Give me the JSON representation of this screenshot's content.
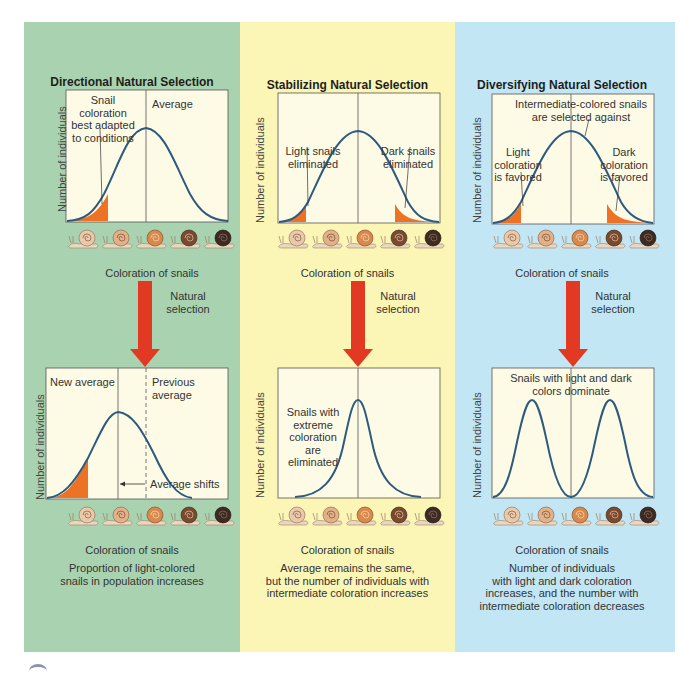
{
  "colors": {
    "green_panel": "#a9d3b0",
    "yellow_panel": "#fbf5b6",
    "blue_panel": "#c3e6f4",
    "plot_bg": "#fdfbe6",
    "curve": "#2e5a7f",
    "fill": "#ec7326",
    "arrow": "#e23a22"
  },
  "common": {
    "y_axis_label": "Number of individuals",
    "x_axis_label": "Coloration of snails",
    "arrow_label_line1": "Natural",
    "arrow_label_line2": "selection"
  },
  "panels": [
    {
      "title": "Directional Natural Selection",
      "top_annotations": [
        "Snail coloration",
        "best adapted",
        "to conditions"
      ],
      "top_average_label": "Average",
      "bottom_annotation_left": "New average",
      "bottom_annotation_right": [
        "Previous",
        "average"
      ],
      "bottom_shift_label": "Average shifts",
      "caption": [
        "Proportion of light-colored",
        "snails in population increases"
      ]
    },
    {
      "title": "Stabilizing Natural Selection",
      "top_left_annotation": [
        "Light snails",
        "eliminated"
      ],
      "top_right_annotation": [
        "Dark snails",
        "eliminated"
      ],
      "bottom_annotation": [
        "Snails with",
        "extreme",
        "coloration are",
        "eliminated"
      ],
      "caption": [
        "Average remains the same,",
        "but the number of individuals with",
        "intermediate coloration increases"
      ]
    },
    {
      "title": "Diversifying Natural Selection",
      "top_center_annotation": [
        "Intermediate-colored snails",
        "are selected against"
      ],
      "top_left_annotation": [
        "Light",
        "coloration",
        "is favored"
      ],
      "top_right_annotation": [
        "Dark",
        "coloration",
        "is favored"
      ],
      "bottom_annotation": [
        "Snails with light and dark",
        "colors dominate"
      ],
      "caption": [
        "Number of individuals",
        "with light and dark coloration",
        "increases, and the number with",
        "intermediate coloration decreases"
      ]
    }
  ],
  "snail_shell_colors": [
    "#e9c9a9",
    "#e2b18a",
    "#d9894c",
    "#7a4a2e",
    "#3d2a22"
  ]
}
